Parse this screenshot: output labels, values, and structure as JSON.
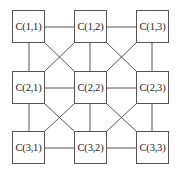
{
  "diagram": {
    "type": "grid-interconnect",
    "rows": 3,
    "cols": 3,
    "line_color": "#555555",
    "nodes": [
      {
        "id": "C11",
        "label": "C(1,1)",
        "row": 1,
        "col": 1
      },
      {
        "id": "C12",
        "label": "C(1,2)",
        "row": 1,
        "col": 2
      },
      {
        "id": "C13",
        "label": "C(1,3)",
        "row": 1,
        "col": 3
      },
      {
        "id": "C21",
        "label": "C(2,1)",
        "row": 2,
        "col": 1
      },
      {
        "id": "C22",
        "label": "C(2,2)",
        "row": 2,
        "col": 2
      },
      {
        "id": "C23",
        "label": "C(2,3)",
        "row": 2,
        "col": 3
      },
      {
        "id": "C31",
        "label": "C(3,1)",
        "row": 3,
        "col": 1
      },
      {
        "id": "C32",
        "label": "C(3,2)",
        "row": 3,
        "col": 2
      },
      {
        "id": "C33",
        "label": "C(3,3)",
        "row": 3,
        "col": 3
      }
    ],
    "edges": [
      [
        "C11",
        "C12"
      ],
      [
        "C12",
        "C13"
      ],
      [
        "C21",
        "C22"
      ],
      [
        "C22",
        "C23"
      ],
      [
        "C31",
        "C32"
      ],
      [
        "C32",
        "C33"
      ],
      [
        "C11",
        "C21"
      ],
      [
        "C21",
        "C31"
      ],
      [
        "C12",
        "C22"
      ],
      [
        "C22",
        "C32"
      ],
      [
        "C13",
        "C23"
      ],
      [
        "C23",
        "C33"
      ],
      [
        "C11",
        "C22"
      ],
      [
        "C12",
        "C21"
      ],
      [
        "C12",
        "C23"
      ],
      [
        "C13",
        "C22"
      ],
      [
        "C21",
        "C32"
      ],
      [
        "C22",
        "C31"
      ],
      [
        "C22",
        "C33"
      ],
      [
        "C23",
        "C32"
      ]
    ]
  }
}
